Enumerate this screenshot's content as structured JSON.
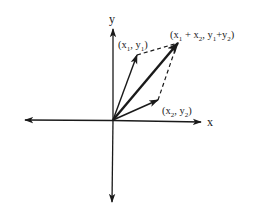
{
  "diagram": {
    "title": "",
    "type": "vector-addition-parallelogram",
    "colors": {
      "ink": "#1a1a1a",
      "background": "#ffffff"
    },
    "axes": {
      "x_label": "x",
      "y_label": "y",
      "origin": [
        113,
        120
      ]
    },
    "vectors": [
      {
        "name": "v1",
        "label": "(x1, y1)",
        "tip": [
          137,
          55
        ],
        "style": "solid"
      },
      {
        "name": "v2",
        "label": "(x2, y2)",
        "tip": [
          158,
          100
        ],
        "style": "solid"
      },
      {
        "name": "sum",
        "label": "(x1 + x2, y1+y2)",
        "tip": [
          178,
          43
        ],
        "style": "solid-bold"
      }
    ],
    "dashed_edges": [
      {
        "from": "v1",
        "to": "sum"
      },
      {
        "from": "v2",
        "to": "sum"
      }
    ],
    "labels": {
      "v1": {
        "open": "(x",
        "sub1": "1",
        "mid": ", y",
        "sub2": "1",
        "close": ")"
      },
      "v2": {
        "open": "(x",
        "sub1": "2",
        "mid": ", y",
        "sub2": "2",
        "close": ")"
      },
      "sum": {
        "open": "(x",
        "sub1": "1",
        "mid1": " + x",
        "sub2": "2",
        "mid2": ", y",
        "sub3": "1",
        "mid3": "+y",
        "sub4": "2",
        "close": ")"
      }
    }
  }
}
